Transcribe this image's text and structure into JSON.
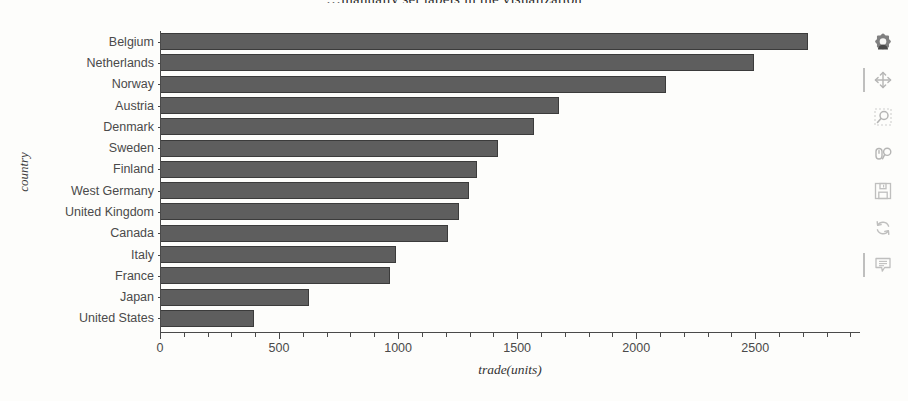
{
  "page": {
    "heading_partial": "…manually set labels in the visualization"
  },
  "chart_data": {
    "type": "bar",
    "orientation": "horizontal",
    "title": "",
    "xlabel": "trade(units)",
    "ylabel": "country",
    "categories": [
      "Belgium",
      "Netherlands",
      "Norway",
      "Austria",
      "Denmark",
      "Sweden",
      "Finland",
      "West Germany",
      "United Kingdom",
      "Canada",
      "Italy",
      "France",
      "Japan",
      "United States"
    ],
    "values": [
      2723,
      2496,
      2125,
      1675,
      1570,
      1418,
      1330,
      1296,
      1254,
      1208,
      993,
      968,
      627,
      396
    ],
    "xlim": [
      0,
      2940
    ],
    "ylim": [
      0,
      14
    ],
    "xticks": [
      0,
      500,
      1000,
      1500,
      2000,
      2500
    ],
    "xtick_labels": [
      "0",
      "500",
      "1000",
      "1500",
      "2000",
      "2500"
    ],
    "grid": false,
    "legend": null,
    "bar_color": "#5e5e5e",
    "bar_line_color": "#3b3b3b"
  },
  "toolbar": {
    "tools": [
      {
        "name": "bokeh-logo-icon",
        "label": "Bokeh"
      },
      {
        "name": "pan-tool-icon",
        "label": "Pan"
      },
      {
        "name": "box-zoom-tool-icon",
        "label": "Box Zoom"
      },
      {
        "name": "wheel-zoom-tool-icon",
        "label": "Wheel Zoom"
      },
      {
        "name": "save-tool-icon",
        "label": "Save"
      },
      {
        "name": "reset-tool-icon",
        "label": "Reset"
      },
      {
        "name": "hover-tool-icon",
        "label": "Hover"
      }
    ]
  }
}
